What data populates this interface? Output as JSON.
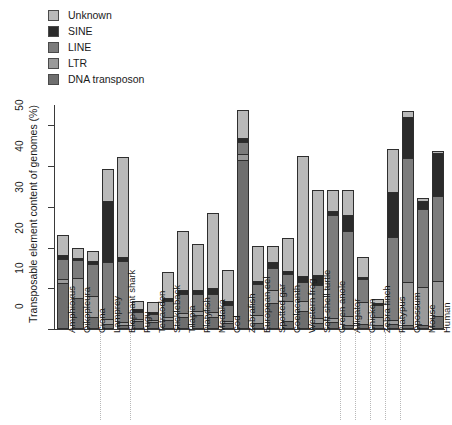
{
  "chart_data": {
    "type": "bar",
    "subtype": "stacked-bar",
    "title": "",
    "xlabel": "",
    "ylabel": "Transposable element content of genomes (%)",
    "ylim": [
      0,
      55
    ],
    "yticks": [
      0,
      10,
      20,
      30,
      40,
      50
    ],
    "ytick_labels": [
      "0",
      "10",
      "20",
      "30",
      "40",
      "50"
    ],
    "grid": false,
    "legend_position": "top-left",
    "series_order_bottom_to_top": [
      "DNA transposon",
      "LTR",
      "LINE",
      "SINE",
      "Unknown"
    ],
    "categories": [
      "Amphioxus",
      "Oikopleura",
      "Ciona",
      "Lamprey",
      "Elephant shark",
      "Fugu",
      "Tetraodon",
      "Stickleback",
      "Tilapia",
      "Platyfish",
      "Medaka",
      "Cod",
      "Zebrafish",
      "European eel",
      "Spotted gar",
      "Coelacanth",
      "Western frog",
      "Soft-shell turtle",
      "Green anole",
      "Alligator",
      "Chicken",
      "Zebra finch",
      "Platypus",
      "Opossum",
      "Mouse",
      "Human"
    ],
    "series": [
      {
        "name": "DNA transposon",
        "color": "#6e6e6e",
        "values": [
          11.2,
          7.5,
          3.0,
          1.2,
          1.0,
          2.0,
          1.6,
          2.2,
          3.0,
          3.5,
          3.0,
          1.4,
          41.5,
          1.5,
          6.5,
          2.0,
          4.5,
          1.5,
          1.6,
          1.1,
          1.2,
          1.0,
          1.2,
          1.0,
          0.9,
          3.2
        ]
      },
      {
        "name": "LTR",
        "color": "#9a9a9a",
        "values": [
          1.0,
          5.0,
          5.0,
          1.2,
          0.8,
          0.5,
          0.5,
          0.7,
          1.0,
          1.0,
          1.2,
          0.6,
          1.5,
          2.0,
          3.0,
          5.0,
          2.5,
          1.2,
          1.0,
          2.0,
          5.5,
          2.0,
          1.0,
          10.5,
          9.5,
          8.5
        ]
      },
      {
        "name": "LINE",
        "color": "#7c7c7c",
        "values": [
          5.0,
          4.5,
          8.0,
          14.0,
          15.0,
          1.8,
          1.5,
          4.0,
          4.5,
          4.0,
          4.5,
          4.0,
          3.0,
          7.5,
          5.5,
          6.5,
          4.5,
          8.0,
          25.5,
          21.0,
          5.5,
          3.0,
          20.5,
          30.5,
          19.0,
          21.0
        ]
      },
      {
        "name": "SINE",
        "color": "#2b2b2b",
        "values": [
          1.0,
          0.5,
          0.6,
          15.0,
          1.0,
          0.5,
          0.5,
          0.8,
          1.0,
          1.0,
          1.5,
          0.8,
          0.8,
          0.8,
          1.5,
          0.8,
          1.5,
          2.5,
          1.0,
          4.0,
          0.6,
          0.5,
          11.0,
          10.0,
          2.0,
          10.5
        ]
      },
      {
        "name": "Unknown",
        "color": "#b9b9b9",
        "values": [
          5.0,
          2.5,
          2.5,
          7.8,
          24.5,
          2.2,
          2.5,
          6.3,
          14.5,
          11.5,
          18.3,
          7.6,
          7.0,
          8.5,
          4.0,
          8.0,
          29.5,
          21.0,
          5.0,
          6.0,
          4.8,
          1.0,
          10.5,
          1.5,
          0.8,
          0.5
        ]
      }
    ],
    "totals": [
      23.2,
      20.0,
      19.1,
      39.2,
      42.3,
      7.0,
      6.6,
      14.0,
      24.0,
      21.0,
      28.5,
      14.4,
      53.8,
      20.3,
      20.5,
      22.3,
      42.5,
      34.2,
      34.1,
      34.1,
      17.6,
      7.5,
      44.2,
      53.5,
      32.2,
      43.7
    ]
  },
  "legend": {
    "items": [
      {
        "label": "Unknown",
        "color": "#b9b9b9"
      },
      {
        "label": "SINE",
        "color": "#2b2b2b"
      },
      {
        "label": "LINE",
        "color": "#7c7c7c"
      },
      {
        "label": "LTR",
        "color": "#9a9a9a"
      },
      {
        "label": "DNA transposon",
        "color": "#6e6e6e"
      }
    ]
  },
  "axes": {
    "y_title": "Transposable element content of genomes (%)",
    "y_ticks": [
      "0",
      "10",
      "20",
      "30",
      "40",
      "50"
    ]
  },
  "separators_after": [
    "Ciona",
    "Elephant shark",
    "Green anole",
    "Alligator",
    "Chicken",
    "Zebra finch",
    "Platypus"
  ]
}
